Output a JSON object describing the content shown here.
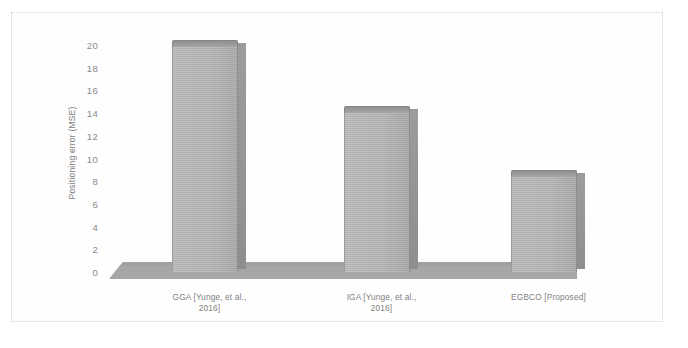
{
  "chart_data": {
    "type": "bar",
    "title": "",
    "subtitle": "",
    "xlabel": "",
    "ylabel": "Positioning error (MSE)",
    "categories": [
      "GGA [Yunge, et al., 2016]",
      "IGA [Yunge, et al., 2016]",
      "EGBCO [Proposed]"
    ],
    "category_lines": [
      [
        "GGA [Yunge, et al.,",
        "2016]"
      ],
      [
        "IGA [Yunge, et al.,",
        "2016]"
      ],
      [
        "EGBCO [Proposed]",
        ""
      ]
    ],
    "values": [
      19.8,
      14.0,
      8.4
    ],
    "ylim": [
      0,
      20
    ],
    "ytick_labels": [
      "20",
      "18",
      "16",
      "14",
      "12",
      "10",
      "8",
      "6",
      "4",
      "2",
      "0"
    ],
    "ytick_values": [
      20,
      18,
      16,
      14,
      12,
      10,
      8,
      6,
      4,
      2,
      0
    ],
    "grid": false,
    "legend": false,
    "legend_position": "none",
    "style": "3d-column",
    "colors": {
      "bar_face": "#b5b5b5",
      "bar_top": "#9a9a9a",
      "bar_side": "#949494",
      "floor": "#a8a8a8",
      "text": "#7f7f7f",
      "frame": "#cfcfcf",
      "background": "#ffffff"
    }
  }
}
